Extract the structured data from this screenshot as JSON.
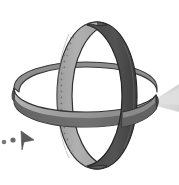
{
  "canvas": {
    "width": 179,
    "height": 185,
    "background_color": "#ffffff",
    "title": "Two interlocking rings with light cone and cursor"
  },
  "palette": {
    "band_light": "#a9a9a9",
    "band_light_top": "#b8b8b8",
    "band_mid": "#9a9a9a",
    "band_dark": "#4f4f4f",
    "band_darker": "#3f3f3f",
    "band_shadow": "#6e6e6e",
    "outline": "#2b2b2b",
    "cone_fill": "#d9d9d9",
    "cone_fill_soft": "#e4e4e4",
    "cursor_fill": "#5b5b5b",
    "dot_fill": "#6a6a6a",
    "stipple": "#6f6f6f",
    "highlight": "#c9c9c9"
  },
  "objects": {
    "vertical_ring": {
      "name": "vertical-ring",
      "description": "Upright oval band seen edge-on, twisting from light gray on the left to dark gray on the right",
      "center_x": 97,
      "center_y": 95,
      "radius_x": 42,
      "radius_y": 73,
      "band_width": 17,
      "left_face_color": "#a9a9a9",
      "right_face_color": "#4f4f4f",
      "has_stipple_seam": true
    },
    "horizontal_ring": {
      "name": "horizontal-ring",
      "description": "Flat elliptical band lying nearly horizontally, passing through the vertical ring",
      "center_x": 85,
      "center_y": 92,
      "radius_x": 72,
      "radius_y": 27,
      "band_width": 15,
      "top_face_color": "#9a9a9a",
      "inner_face_color": "#5a5a5a"
    },
    "light_cone": {
      "name": "light-cone",
      "description": "Pale gray triangular beam spreading from the right side of the horizontal ring to the right edge",
      "apex_x": 150,
      "apex_y": 103,
      "fill": "#d9d9d9",
      "direction": "right"
    },
    "cursor": {
      "name": "mouse-cursor",
      "description": "Small dark triangular pointer aimed right with two trailing dots",
      "x": 19,
      "y": 133,
      "fill": "#5b5b5b",
      "trail_dots": 2
    }
  },
  "labels": {
    "scene_title": "Interlocking rings",
    "alt_text": "Grayscale 3D drawing of a vertical ring and a horizontal ring linked together, a light beam to the right, and a mouse cursor at lower left"
  }
}
